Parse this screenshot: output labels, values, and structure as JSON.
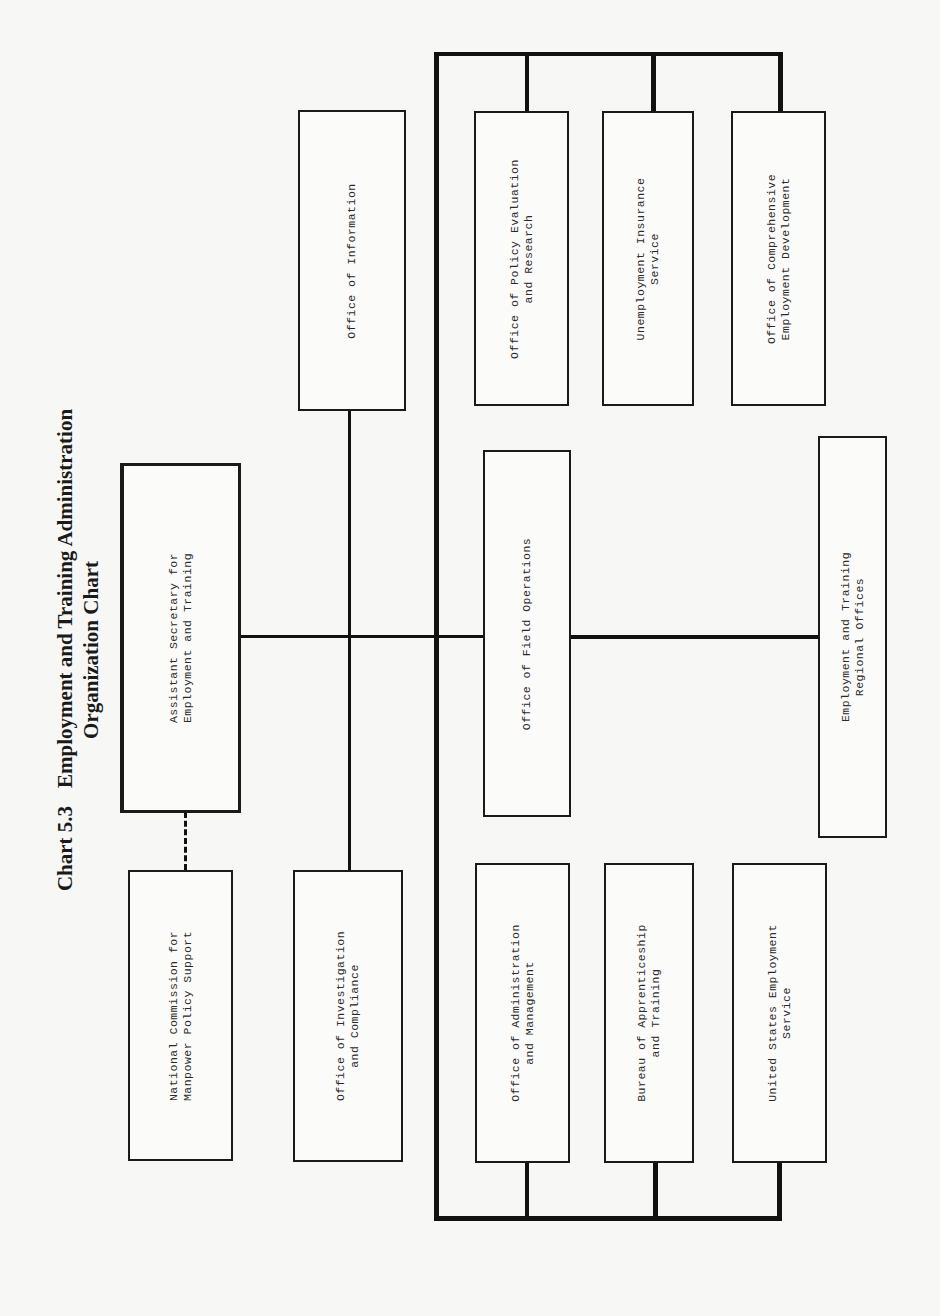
{
  "chart": {
    "number": "Chart 5.3",
    "title_line1": "Employment and Training Administration",
    "title_line2": "Organization Chart"
  },
  "boxes": {
    "assistant_secretary": "Assistant Secretary for\nEmployment and Training",
    "national_commission": "National Commission for\nManpower Policy Support",
    "office_information": "Office of Information",
    "office_investigation": "Office of Investigation\nand Compliance",
    "office_policy_evaluation": "Office of Policy Evaluation\nand Research",
    "unemployment_insurance": "Unemployment Insurance\nService",
    "office_comprehensive": "Office of Comprehensive\nEmployment Development",
    "office_field_operations": "Office of Field Operations",
    "regional_offices": "Employment and Training\nRegional Offices",
    "office_administration": "Office of Administration\nand Management",
    "bureau_apprenticeship": "Bureau of Apprenticeship\nand Training",
    "us_employment_service": "United States Employment\nService"
  },
  "colors": {
    "line": "#111111",
    "paper": "#f7f7f5"
  }
}
